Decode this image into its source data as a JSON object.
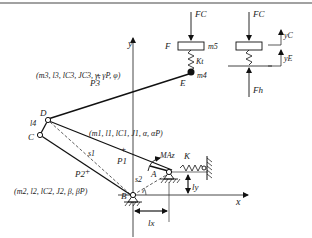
{
  "diagram": {
    "type": "mechanism-schematic",
    "axes": {
      "x_label": "x",
      "y_label": "y"
    },
    "points": {
      "A": "A",
      "B": "B",
      "C": "C",
      "D": "D",
      "E": "E",
      "F": "F"
    },
    "links": {
      "link1_params": "(m1, l1, lC1, J1, α, αP)",
      "link2_params": "(m2, l2, lC2, J2, β, βP)",
      "link3_params": "(m3, l3, lC3, JC3, γ, γP, φ)",
      "link4_label": "l4"
    },
    "centers": {
      "P1": "P1",
      "P2": "P2",
      "P3": "P3"
    },
    "distances": {
      "s1": "s1",
      "s2": "s2",
      "epsilon": "ε",
      "lx": "lx",
      "ly": "ly"
    },
    "moment": "MAz",
    "spring_K": "K",
    "spring_Kt": "Kt",
    "masses": {
      "m4": "m4",
      "m5": "m5"
    },
    "forces": {
      "FC": "FC",
      "Fh": "Fh"
    },
    "displacements": {
      "yC": "yC",
      "yE": "yE"
    }
  }
}
